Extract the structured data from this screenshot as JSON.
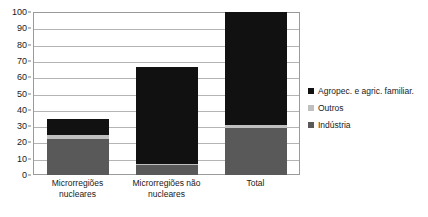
{
  "chart_data": {
    "type": "bar",
    "subtype": "stacked-column",
    "title": "",
    "subtitle": "",
    "xlabel": "",
    "ylabel": "",
    "ylim": [
      0,
      100
    ],
    "ytick_step": 10,
    "ytick_labels": [
      "100",
      "90",
      "80",
      "70",
      "60",
      "50",
      "40",
      "30",
      "20",
      "10",
      "0"
    ],
    "ytick_values": [
      100,
      90,
      80,
      70,
      60,
      50,
      40,
      30,
      20,
      10,
      0
    ],
    "grid": true,
    "grid_axis": "y",
    "legend_position": "right",
    "categories": [
      "Microrregiões nucleares",
      "Microrregiões não nucleares",
      "Total"
    ],
    "category_lines": [
      [
        "Microrregiões",
        "nucleares"
      ],
      [
        "Microrregiões não",
        "nucleares"
      ],
      [
        "Total"
      ]
    ],
    "series": [
      {
        "name": "Indústria",
        "color": "#595959",
        "values": [
          22,
          6,
          29
        ]
      },
      {
        "name": "Outros",
        "color": "#bfbfbf",
        "values": [
          2.5,
          0.5,
          1.5
        ]
      },
      {
        "name": "Agropec. e agric. familiar.",
        "color": "#111111",
        "values": [
          10,
          59.5,
          69.5
        ]
      }
    ],
    "stack_order_bottom_to_top": [
      "Indústria",
      "Outros",
      "Agropec. e agric. familiar."
    ],
    "totals": [
      34.5,
      66,
      100
    ]
  },
  "legend": {
    "items": [
      {
        "label": "Agropec. e agric. familiar.",
        "color": "#111111"
      },
      {
        "label": "Outros",
        "color": "#bfbfbf"
      },
      {
        "label": "Indústria",
        "color": "#595959"
      }
    ]
  },
  "colors": {
    "plot_border": "#9a9a9a",
    "gridline": "#b4b4b4",
    "background": "#ffffff",
    "text": "#1a1a1a"
  }
}
